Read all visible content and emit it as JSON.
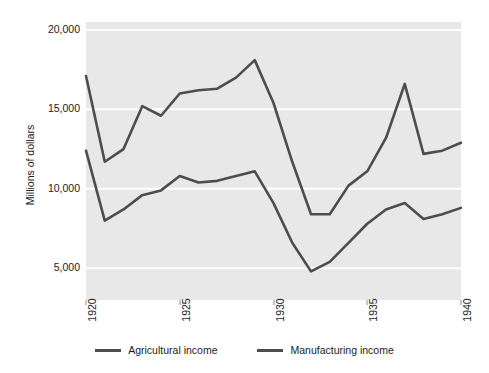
{
  "chart_data": {
    "type": "line",
    "title": "",
    "xlabel": "",
    "ylabel": "Millions of dollars",
    "x": [
      1920,
      1921,
      1922,
      1923,
      1924,
      1925,
      1926,
      1927,
      1928,
      1929,
      1930,
      1931,
      1932,
      1933,
      1934,
      1935,
      1936,
      1937,
      1938,
      1939,
      1940
    ],
    "xlim": [
      1920,
      1940
    ],
    "ylim": [
      3000,
      20500
    ],
    "xticks": [
      1920,
      1925,
      1930,
      1935,
      1940
    ],
    "xtick_labels": [
      "1920",
      "1925",
      "1930",
      "1935",
      "1940"
    ],
    "yticks": [
      5000,
      10000,
      15000,
      20000
    ],
    "ytick_labels": [
      "5,000",
      "10,000",
      "15,000",
      "20,000"
    ],
    "grid": "horizontal",
    "legend_position": "bottom",
    "plot_background": "#e8e8e8",
    "line_color": "#4d4d4d",
    "series": [
      {
        "name": "Agricultural income",
        "color": "#4d4d4d",
        "values": [
          12400,
          8000,
          8700,
          9600,
          9900,
          10800,
          10400,
          10500,
          10800,
          11100,
          9100,
          6600,
          4800,
          5400,
          6600,
          7800,
          8700,
          9100,
          8100,
          8400,
          8800
        ]
      },
      {
        "name": "Manufacturing income",
        "color": "#4d4d4d",
        "values": [
          17100,
          11700,
          12500,
          15200,
          14600,
          16000,
          16200,
          16300,
          17000,
          18100,
          15400,
          11700,
          8400,
          8400,
          10200,
          11100,
          13200,
          16600,
          12200,
          12400,
          12900
        ]
      }
    ]
  },
  "axis": {
    "y_title": "Millions of dollars"
  },
  "legend": {
    "items": [
      {
        "label": "Agricultural income",
        "color": "#4d4d4d"
      },
      {
        "label": "Manufacturing income",
        "color": "#4d4d4d"
      }
    ]
  }
}
